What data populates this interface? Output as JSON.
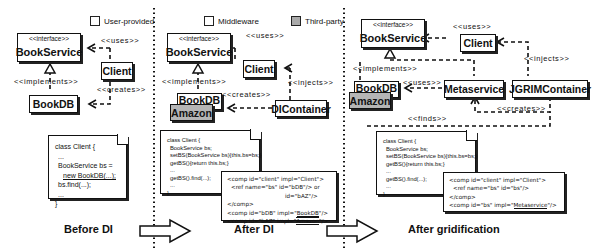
{
  "legend": {
    "user_provided": "User-provided",
    "middleware": "Middleware",
    "third_party": "Third-party"
  },
  "colors": {
    "third_party_fill": "#b5b5b5",
    "stroke": "#111111"
  },
  "panels": {
    "before_di": {
      "caption": "Before DI",
      "boxes": {
        "bookservice": {
          "stereotype": "<<interface>>",
          "name": "BookService"
        },
        "client": {
          "name": "Client"
        },
        "bookdb": {
          "name": "BookDB"
        }
      },
      "labels": {
        "uses": "<<uses>>",
        "implements": "<<implements>>",
        "creates": "<<creates>>"
      },
      "code": [
        "class Client {",
        "...",
        "BookService bs =",
        "new BookDB(...);",
        "bs.find(...);",
        "...",
        "}"
      ]
    },
    "after_di": {
      "caption": "After DI",
      "boxes": {
        "bookservice": {
          "stereotype": "<<interface>>",
          "name": "BookService"
        },
        "client": {
          "name": "Client"
        },
        "bookdb": {
          "name": "BookDB"
        },
        "amazon": {
          "name": "Amazon"
        },
        "dicontainer": {
          "name": "DIContainer"
        }
      },
      "labels": {
        "uses": "<<uses>>",
        "implements": "<<implements>>",
        "creates": "<<creates>>",
        "injects": "<<injects>>"
      },
      "code": [
        "class Client {",
        "BookService bs;",
        "setBS(BookService bs){this.bs=bs;}",
        "getBS(){return this.bs;}",
        "...",
        "getBS().find(...);",
        "...",
        "}"
      ],
      "xml": [
        "<comp id=\"client\" impl=\"Client\">",
        "<ref name=\"bs\" id=\"bDB\"/> or",
        "id=\"bAZ\"/>",
        "</comp>",
        "<comp id=\"bDB\" impl=\"",
        "BookDB",
        "\"/>",
        "<comp id=\"bAZ\" impl=\"",
        "Amazon",
        "\"/>"
      ]
    },
    "after_gridification": {
      "caption": "After gridification",
      "boxes": {
        "bookservice": {
          "stereotype": "<<interface>>",
          "name": "BookService"
        },
        "client": {
          "name": "Client"
        },
        "bookdb": {
          "name": "BookDB"
        },
        "amazon": {
          "name": "Amazon"
        },
        "metaservice": {
          "name": "Metaservice"
        },
        "jgrimcontainer": {
          "name": "JGRIMContainer"
        }
      },
      "labels": {
        "uses": "<<uses>>",
        "uses2": "<<uses>>",
        "implements": "<<implements>>",
        "injects": "<<injects>>",
        "creates": "<<creates>>",
        "finds": "<<finds>>"
      },
      "code": [
        "class Client {",
        "BookService bs;",
        "setBS(BookService bs){this.bs=bs;}",
        "getBS(){return this.bs;}",
        "...",
        "getBS().find(...);",
        "...",
        "}"
      ],
      "xml": [
        "<comp id=\"client\" impl=\"Client\">",
        "<ref name=\"bs\" id=\"bs\"/>",
        "</comp>",
        "<comp id=\"bs\" impl=\"",
        "Metaservice",
        "\"/>"
      ]
    }
  }
}
